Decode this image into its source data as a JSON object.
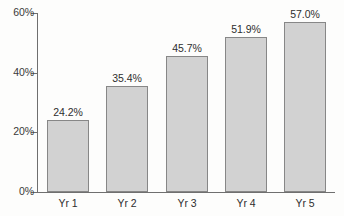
{
  "chart_data": {
    "type": "bar",
    "title": "",
    "subtitle": "",
    "xlabel": "",
    "ylabel": "",
    "categories": [
      "Yr 1",
      "Yr 2",
      "Yr 3",
      "Yr 4",
      "Yr 5"
    ],
    "values": [
      24.2,
      35.4,
      45.7,
      51.9,
      57.0
    ],
    "value_labels": [
      "24.2%",
      "35.4%",
      "45.7%",
      "51.9%",
      "57.0%"
    ],
    "ylim": [
      0,
      60
    ],
    "yticks": [
      0,
      20,
      40,
      60
    ],
    "ytick_labels": [
      "0%",
      "20%",
      "40%",
      "60%"
    ],
    "grid": false,
    "legend": null,
    "series": [
      {
        "name": "",
        "values": [
          24.2,
          35.4,
          45.7,
          51.9,
          57.0
        ]
      }
    ],
    "colors": {
      "bar_fill": "#d2d2d2",
      "bar_border": "#878787",
      "axis": "#6f6f6f",
      "text": "#2e2e2e",
      "background": "#fdfdfc"
    }
  }
}
